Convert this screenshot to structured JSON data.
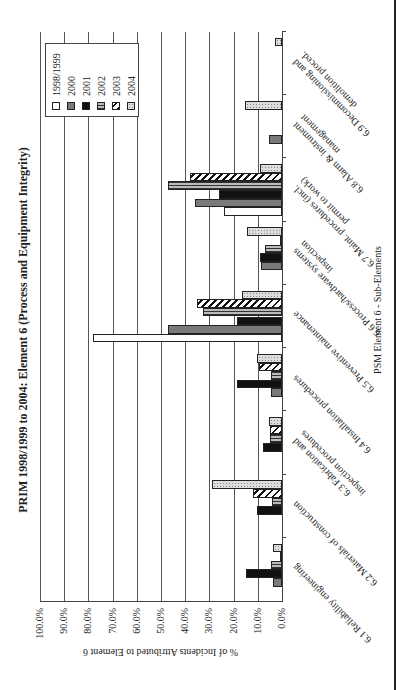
{
  "chart_data": {
    "type": "bar",
    "orientation": "rotated -90deg (vertical column chart displayed sideways)",
    "title": "PRIM 1998/1999 to 2004: Element 6 (Process and Equipment Integrity)",
    "xlabel": "PSM Element 6 - Sub-Elements",
    "ylabel": "% of Incidents Attributed to Element 6",
    "ylim": [
      0,
      100
    ],
    "yticks": [
      "0.0%",
      "10.0%",
      "20.0%",
      "30.0%",
      "40.0%",
      "50.0%",
      "60.0%",
      "70.0%",
      "80.0%",
      "90.0%",
      "100.0%"
    ],
    "grid": true,
    "legend_position": "upper right",
    "categories": [
      "6.1 Reliability engineering",
      "6.2 Materials of construction",
      "6.3 Fabrication and inspection procedures",
      "6.4 Installation procedures",
      "6.5 Preventive maintenance",
      "6.6 Process/hardware systems inspection",
      "6.7 Maint. procedures (incl. permit to work)",
      "6.8 Alarm & instrument management",
      "6.9 Decommissioning and demolition proced."
    ],
    "series": [
      {
        "name": "1998/1999",
        "values": [
          0,
          0,
          0,
          0,
          78,
          0,
          24,
          0,
          0
        ]
      },
      {
        "name": "2000",
        "values": [
          3.7,
          0,
          0,
          4.5,
          47,
          8.6,
          36,
          5.3,
          0
        ]
      },
      {
        "name": "2001",
        "values": [
          14.8,
          10.3,
          7.8,
          18.5,
          18.5,
          9,
          26,
          0,
          0
        ]
      },
      {
        "name": "2002",
        "values": [
          4.5,
          4,
          4.9,
          4.5,
          32.5,
          7,
          47,
          0,
          0
        ]
      },
      {
        "name": "2003",
        "values": [
          1,
          12,
          4.9,
          9.5,
          35,
          1,
          38,
          0,
          0
        ]
      },
      {
        "name": "2004",
        "values": [
          3.7,
          29,
          5.3,
          10.3,
          16.5,
          14.4,
          9,
          15.5,
          3
        ]
      }
    ]
  }
}
